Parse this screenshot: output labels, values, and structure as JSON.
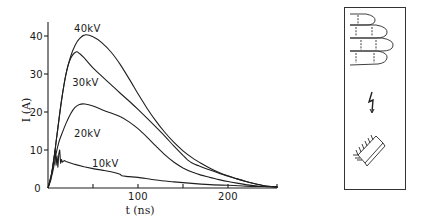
{
  "chart_data": {
    "type": "line",
    "title": "",
    "xlabel": "t (ns)",
    "ylabel": "I (A)",
    "xlim": [
      0,
      255
    ],
    "ylim": [
      0,
      43
    ],
    "x_ticks": [
      0,
      50,
      100,
      150,
      200
    ],
    "x_tick_labels": [
      "100",
      "200"
    ],
    "x_tick_label_values": [
      100,
      200
    ],
    "y_ticks": [
      0,
      10,
      20,
      30,
      40
    ],
    "y_tick_labels": [
      "0",
      "10",
      "20",
      "30",
      "40"
    ],
    "grid": false,
    "legend": "inline curve labels",
    "series": [
      {
        "name": "40kV",
        "label_pos": [
          40,
          42
        ],
        "x": [
          0,
          5,
          10,
          15,
          20,
          25,
          30,
          35,
          41,
          50,
          60,
          70,
          80,
          90,
          100,
          110,
          120,
          130,
          140,
          150,
          160,
          170,
          180,
          190,
          200,
          210,
          220,
          230,
          240,
          255
        ],
        "y": [
          0,
          5,
          14,
          23,
          30,
          34.5,
          37.5,
          39.3,
          40.3,
          39.8,
          38.2,
          35.8,
          32.6,
          28.8,
          24.8,
          21,
          17.6,
          14.6,
          12,
          9.8,
          8,
          6.5,
          5.2,
          4.1,
          3.2,
          2.4,
          1.7,
          1.1,
          0.6,
          0.3
        ]
      },
      {
        "name": "30kV",
        "label_pos": [
          38,
          28
        ],
        "x": [
          0,
          5,
          10,
          15,
          20,
          25,
          31,
          35,
          40,
          50,
          60,
          70,
          80,
          90,
          100,
          110,
          120,
          130,
          140,
          150,
          155,
          160,
          170,
          180,
          190,
          200,
          210,
          220,
          230,
          240,
          255
        ],
        "y": [
          0,
          5,
          14,
          23,
          30,
          34,
          35.8,
          35.4,
          34.3,
          31.6,
          29.4,
          27.2,
          25,
          22.9,
          20.7,
          18.4,
          16,
          13.6,
          11,
          8.6,
          7.4,
          6.6,
          5.6,
          4.7,
          3.9,
          3.1,
          2.4,
          1.7,
          1.1,
          0.6,
          0.3
        ]
      },
      {
        "name": "20kV",
        "label_pos": [
          40,
          14.5
        ],
        "x": [
          0,
          5,
          9,
          12,
          15,
          20,
          25,
          30,
          35,
          41,
          50,
          60,
          70,
          80,
          90,
          100,
          110,
          120,
          130,
          140,
          150,
          160,
          170,
          180,
          190,
          200,
          210,
          220,
          230,
          240,
          255
        ],
        "y": [
          0,
          4,
          9,
          12,
          14,
          17,
          19.5,
          21.2,
          22,
          22.1,
          21.6,
          20.6,
          19.7,
          18.8,
          17.4,
          15.6,
          13.4,
          11,
          8.7,
          6.8,
          5.3,
          4.2,
          3.4,
          2.8,
          2.2,
          1.7,
          1.3,
          0.9,
          0.6,
          0.4,
          0.2
        ]
      },
      {
        "name": "10kV",
        "label_pos": [
          60,
          6.5
        ],
        "x": [
          0,
          3,
          6,
          8,
          9,
          10,
          11,
          12,
          13,
          14,
          15,
          16,
          18,
          20,
          30,
          40,
          50,
          60,
          70,
          80,
          82,
          90,
          100,
          120,
          140,
          160,
          180,
          200,
          220,
          240,
          255
        ],
        "y": [
          0,
          2,
          7,
          10,
          6,
          8.5,
          5.5,
          9,
          10,
          6.5,
          7.5,
          6.8,
          7.2,
          7,
          6.2,
          5.6,
          5.1,
          4.7,
          4.3,
          3.6,
          3.2,
          3,
          2.8,
          2.1,
          1.6,
          1.2,
          0.9,
          0.7,
          0.5,
          0.4,
          0.3
        ]
      }
    ]
  },
  "inset": {
    "description": "Schematic panel: fingers touching, spark, IC chip (electrostatic discharge)",
    "icons": [
      "fingers-icon",
      "lightning-bolt-icon",
      "ic-chip-icon"
    ]
  },
  "labels": {
    "xlabel": "t (ns)",
    "ylabel": "I (A)",
    "x_tick_100": "100",
    "x_tick_200": "200",
    "y_tick_0": "0",
    "y_tick_10": "10",
    "y_tick_20": "20",
    "y_tick_30": "30",
    "y_tick_40": "40",
    "series_40": "40kV",
    "series_30": "30kV",
    "series_20": "20kV",
    "series_10": "10kV"
  }
}
